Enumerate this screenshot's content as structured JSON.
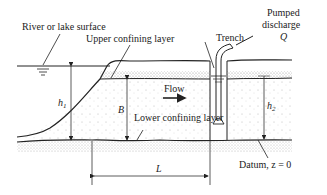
{
  "diagram": {
    "type": "cross-section",
    "labels": {
      "river_surface": "River or lake surface",
      "upper_layer": "Upper confining layer",
      "lower_layer": "Lower confining layer",
      "trench": "Trench",
      "pumped_line1": "Pumped",
      "pumped_line2": "discharge",
      "discharge_symbol": "Q",
      "flow": "Flow",
      "datum": "Datum, z = 0",
      "h1_base": "h",
      "h1_sub": "1",
      "h2_base": "h",
      "h2_sub": "2",
      "B": "B",
      "L": "L"
    },
    "colors": {
      "line": "#222222",
      "stipple": "#9a9a9a",
      "background": "#ffffff"
    }
  }
}
